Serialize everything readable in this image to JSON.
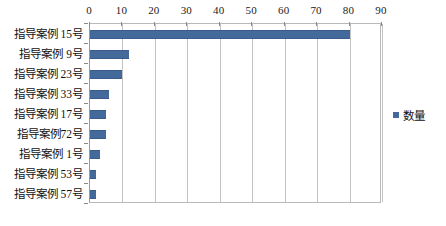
{
  "chart_data": {
    "type": "bar",
    "orientation": "horizontal",
    "title": "",
    "xlabel": "",
    "ylabel": "",
    "xlim": [
      0,
      90
    ],
    "xticks": [
      0,
      10,
      20,
      30,
      40,
      50,
      60,
      70,
      80,
      90
    ],
    "xtick_labels": [
      "0",
      "10",
      "20",
      "30",
      "40",
      "50",
      "60",
      "70",
      "80",
      "90"
    ],
    "x_axis_position": "top",
    "grid": "vertical",
    "legend_position": "right",
    "categories": [
      "指导案例 15号",
      "指导案例 9号",
      "指导案例 23号",
      "指导案例 33号",
      "指导案例 17号",
      "指导案例72号",
      "指导案例 1号",
      "指导案例 53号",
      "指导案例 57号"
    ],
    "series": [
      {
        "name": "数量",
        "color": "#44699b",
        "values": [
          80,
          12,
          10,
          6,
          5,
          5,
          3,
          2,
          2
        ]
      }
    ]
  },
  "legend": {
    "items": [
      {
        "label": "数量",
        "color": "#44699b"
      }
    ]
  },
  "colors": {
    "bar": "#44699b",
    "gridline": "#c2c2c2",
    "axis": "#8a8a8a",
    "text": "#111111",
    "background": "#ffffff"
  }
}
